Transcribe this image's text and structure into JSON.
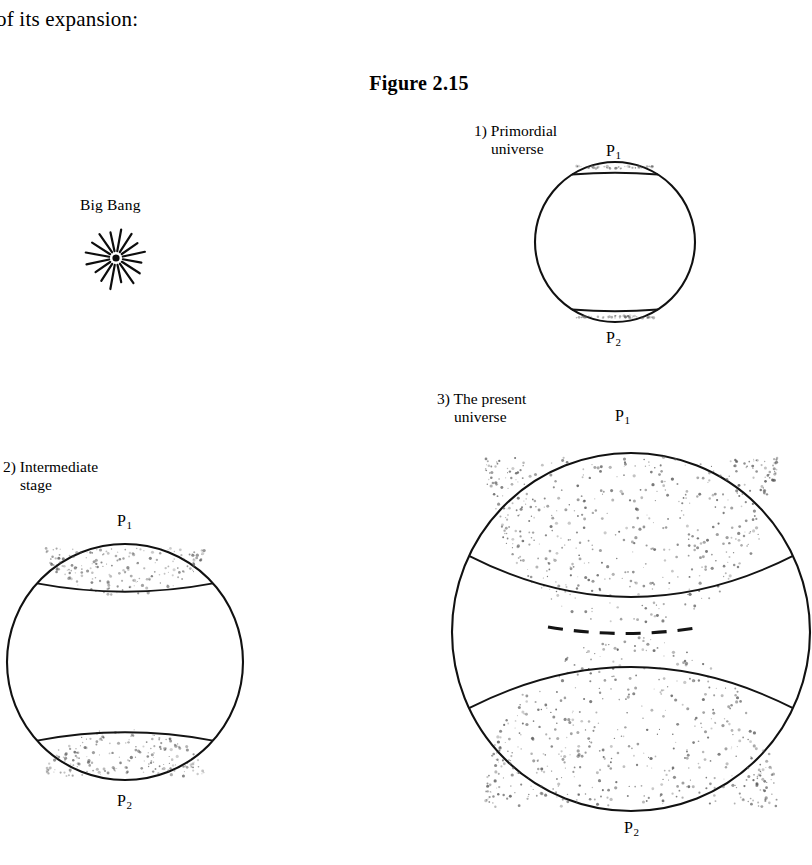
{
  "document": {
    "body_text": "of its expansion:",
    "figure_title": "Figure 2.15"
  },
  "bigbang": {
    "label": "Big Bang",
    "icon": "starburst-icon",
    "ray_count": 16,
    "center": {
      "x": 116,
      "y": 258
    },
    "inner_radius": 7,
    "outer_radius": 28,
    "dot_radius": 3.6
  },
  "panels": [
    {
      "id": "primordial",
      "index": "1)",
      "caption_line1": "1) Primordial",
      "caption_line2": "universe",
      "caption_x": 474,
      "caption_y": 122,
      "top_label": "P",
      "top_sub": "1",
      "bottom_label": "P",
      "bottom_sub": "2",
      "top_label_x": 606,
      "top_label_y": 143,
      "bottom_label_x": 606,
      "bottom_label_y": 330,
      "circle": {
        "cx": 615,
        "cy": 242,
        "r": 80
      },
      "cap_depth": 9,
      "cap_half_width": 43,
      "stipple_density": "light"
    },
    {
      "id": "intermediate",
      "index": "2)",
      "caption_line1": "2) Intermediate",
      "caption_line2": "stage",
      "caption_x": 3,
      "caption_y": 458,
      "top_label": "P",
      "top_sub": "1",
      "bottom_label": "P",
      "bottom_sub": "2",
      "top_label_x": 117,
      "top_label_y": 513,
      "bottom_label_x": 117,
      "bottom_label_y": 793,
      "circle": {
        "cx": 125,
        "cy": 662,
        "r": 118
      },
      "cap_depth": 56,
      "cap_half_width": 88,
      "stipple_density": "medium"
    },
    {
      "id": "present",
      "index": "3)",
      "caption_line1": "3) The present",
      "caption_line2": "universe",
      "caption_x": 437,
      "caption_y": 390,
      "top_label": "P",
      "top_sub": "1",
      "bottom_label": "P",
      "bottom_sub": "2",
      "top_label_x": 615,
      "top_label_y": 408,
      "bottom_label_x": 624,
      "bottom_label_y": 820,
      "circle": {
        "cx": 631,
        "cy": 632,
        "r": 179
      },
      "cap_depth": 185,
      "cap_half_width": 162,
      "stipple_density": "heavy",
      "dashed_arc": {
        "x1": 548,
        "y1": 627,
        "x2": 702,
        "y2": 627,
        "sag": 13,
        "dash_count": 7
      }
    }
  ],
  "colors": {
    "ink": "#111111",
    "paper": "#ffffff",
    "stipple": "#5a5a5a"
  }
}
